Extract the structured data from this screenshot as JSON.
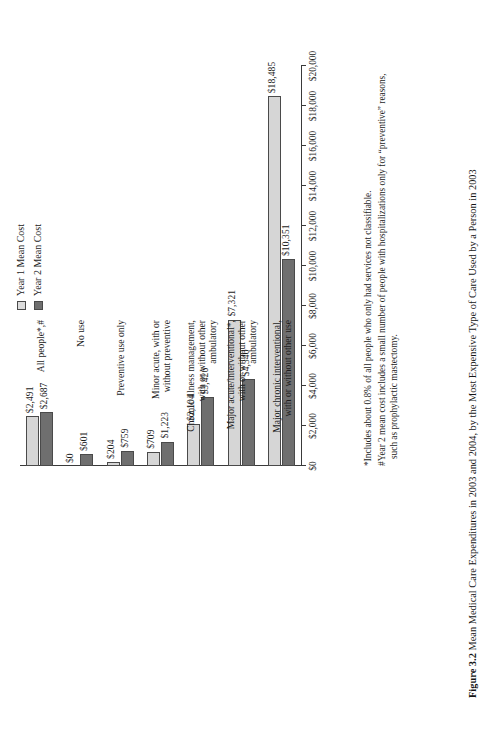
{
  "figure": {
    "caption_label": "Figure 3.2",
    "caption_text": "Mean Medical Care Expenditures in 2003 and 2004, by the Most Expensive Type of Care Used by a Person in 2003"
  },
  "legend": {
    "position": "top-right",
    "items": [
      {
        "label": "Year 1 Mean Cost",
        "color": "#dcdcdc",
        "swatch": "light-square"
      },
      {
        "label": "Year 2 Mean Cost",
        "color": "#6f6f6f",
        "swatch": "dark-square"
      }
    ]
  },
  "footnotes": [
    {
      "marker": "*",
      "text": "Includes about 0.8% of all people who only had services not classifiable."
    },
    {
      "marker": "#",
      "text": "Year 2 mean cost includes a small number of people with hospitalizations only for “preventive” reasons,",
      "continuation": "such as prophylactic mastectomy."
    }
  ],
  "chart_data": {
    "type": "bar",
    "orientation": "horizontal",
    "title": "Mean Medical Care Expenditures in 2003 and 2004, by the Most Expensive Type of Care Used by a Person in 2003",
    "xlabel": "",
    "ylabel": "",
    "xlim": [
      0,
      20000
    ],
    "grid": false,
    "tick_labels": [
      "$0",
      "$2,000",
      "$4,000",
      "$6,000",
      "$8,000",
      "$10,000",
      "$12,000",
      "$14,000",
      "$16,000",
      "$18,000",
      "$20,000"
    ],
    "tick_values": [
      0,
      2000,
      4000,
      6000,
      8000,
      10000,
      12000,
      14000,
      16000,
      18000,
      20000
    ],
    "categories": [
      {
        "lines": [
          "All people*,#"
        ]
      },
      {
        "lines": [
          "No use"
        ]
      },
      {
        "lines": [
          "Preventive use only"
        ]
      },
      {
        "lines": [
          "Minor acute, with or",
          "without preventive"
        ]
      },
      {
        "lines": [
          "Chronic illness management,",
          "with or without other",
          "ambulatory"
        ]
      },
      {
        "lines": [
          "Major acute/interventional*,",
          "with or without other",
          "ambulatory"
        ]
      },
      {
        "lines": [
          "Major chronic interventional,",
          "with or without other use"
        ]
      }
    ],
    "series": [
      {
        "name": "Year 1 Mean Cost",
        "color": "#d6d6d6",
        "values": [
          2491,
          0,
          204,
          709,
          2104,
          7321,
          18485
        ],
        "labels": [
          "$2,491",
          "$0",
          "$204",
          "$709",
          "$2,104",
          "$7,321",
          "$18,485"
        ]
      },
      {
        "name": "Year 2 Mean Cost",
        "color": "#6f6f6f",
        "values": [
          2687,
          601,
          759,
          1223,
          3426,
          4340,
          10351
        ],
        "labels": [
          "$2,687",
          "$601",
          "$759",
          "$1,223",
          "$3,426",
          "$4,340",
          "$10,351"
        ]
      }
    ]
  }
}
